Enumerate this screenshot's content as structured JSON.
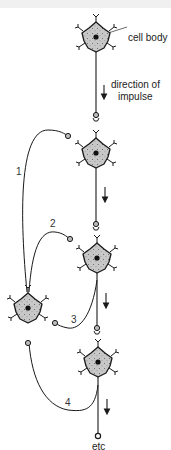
{
  "figure": {
    "labels": {
      "cell_body": "cell body",
      "direction_line1": "direction of",
      "direction_line2": "impulse",
      "end": "etc"
    },
    "pathways": [
      "1",
      "2",
      "3",
      "4"
    ],
    "colors": {
      "cell_fill": "#c8c8c8",
      "stroke": "#1a1a1a",
      "background": "#ffffff",
      "top_band": "#f0f0f0"
    },
    "neurons": [
      {
        "id": "n1",
        "cx": 96,
        "cy": 37
      },
      {
        "id": "n2",
        "cx": 96,
        "cy": 153
      },
      {
        "id": "n3",
        "cx": 97,
        "cy": 258
      },
      {
        "id": "n4",
        "cx": 28,
        "cy": 308
      },
      {
        "id": "n5",
        "cx": 98,
        "cy": 362
      }
    ]
  }
}
